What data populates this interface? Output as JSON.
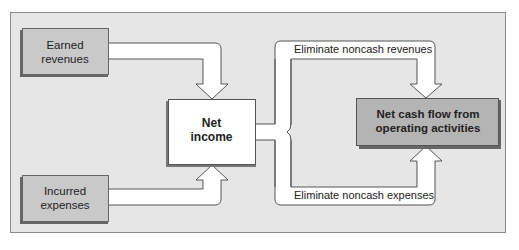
{
  "diagram": {
    "title": "",
    "colors": {
      "frame_fill": "#e6e6e6",
      "frame_border": "#8c8c8c",
      "input_box_fill": "#c9c9c9",
      "result_box_fill": "#b4b4b4",
      "net_income_fill": "#ffffff",
      "arrow_fill": "#ffffff",
      "stroke": "#555555"
    },
    "nodes": {
      "earned_revenues": {
        "line1": "Earned",
        "line2": "revenues"
      },
      "incurred_expenses": {
        "line1": "Incurred",
        "line2": "expenses"
      },
      "net_income": {
        "line1": "Net",
        "line2": "income"
      },
      "net_cash_flow": {
        "line1": "Net cash flow from",
        "line2": "operating activities"
      }
    },
    "edges": {
      "eliminate_revenues": "Eliminate noncash revenues",
      "eliminate_expenses": "Eliminate noncash expenses"
    }
  }
}
